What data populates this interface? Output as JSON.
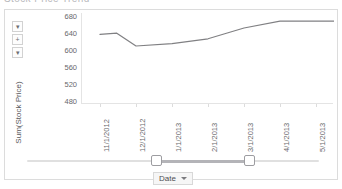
{
  "top_strip": {
    "ghost_title": "Stock Price Trend"
  },
  "axis_controls": {
    "zoom_out_label": "▾",
    "zoom_in_label": "+",
    "pan_label": "▾"
  },
  "y_axis": {
    "title": "Sum(Stock Price)",
    "ticks": [
      "680",
      "640",
      "600",
      "560",
      "520",
      "480"
    ]
  },
  "x_axis": {
    "ticks": [
      "11/1/2012",
      "12/1/2012",
      "1/1/2013",
      "2/1/2013",
      "3/1/2013",
      "4/1/2013",
      "5/1/2013"
    ]
  },
  "slider": {
    "left_handle_label": "range-start",
    "right_handle_label": "range-end"
  },
  "dropdown": {
    "label": "Date"
  },
  "colors": {
    "line": "#808083",
    "card_border": "#dcdcdc",
    "axis": "#e4e4e4",
    "tick_text": "#68686c",
    "slider_range": "#b4b4b8"
  },
  "chart_data": {
    "type": "line",
    "title": "",
    "xlabel": "Date",
    "ylabel": "Sum(Stock Price)",
    "ylim": [
      480,
      680
    ],
    "yticks": [
      480,
      520,
      560,
      600,
      640,
      680
    ],
    "grid": false,
    "legend": null,
    "x": [
      "11/1/2012",
      "12/1/2012",
      "1/1/2013",
      "2/1/2013",
      "3/1/2013",
      "4/1/2013",
      "5/1/2013"
    ],
    "series": [
      {
        "name": "Sum(Stock Price)",
        "values": [
          639,
          610,
          616,
          628,
          655,
          672,
          672
        ]
      }
    ],
    "points": [
      {
        "x": "11/1/2012",
        "y": 639
      },
      {
        "x": "11/15/2012",
        "y": 642
      },
      {
        "x": "12/1/2012",
        "y": 610
      },
      {
        "x": "1/1/2013",
        "y": 616
      },
      {
        "x": "2/1/2013",
        "y": 628
      },
      {
        "x": "3/1/2013",
        "y": 655
      },
      {
        "x": "4/1/2013",
        "y": 672
      },
      {
        "x": "5/1/2013",
        "y": 672
      }
    ]
  }
}
